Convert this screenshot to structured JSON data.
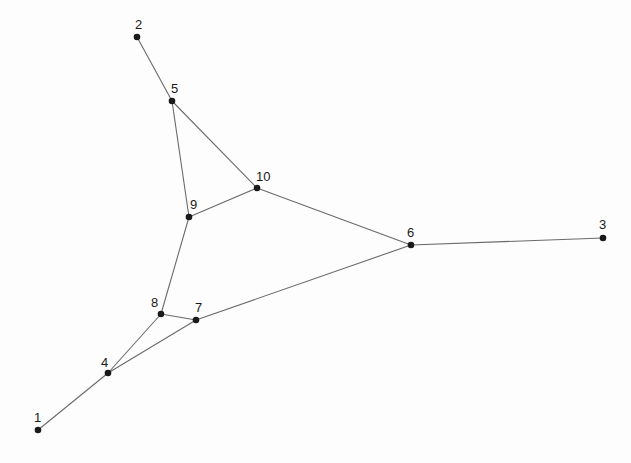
{
  "diagram": {
    "type": "undirected-graph",
    "colors": {
      "background": "#fdfdfd",
      "edge": "#6a6a6a",
      "node": "#1a1a1a",
      "label": "#1a1a1a"
    },
    "nodes": [
      {
        "id": "1",
        "label": "1",
        "x": 38,
        "y": 430,
        "lx": 34,
        "ly": 422
      },
      {
        "id": "2",
        "label": "2",
        "x": 137,
        "y": 37,
        "lx": 135,
        "ly": 29
      },
      {
        "id": "3",
        "label": "3",
        "x": 603,
        "y": 238,
        "lx": 599,
        "ly": 229
      },
      {
        "id": "4",
        "label": "4",
        "x": 108,
        "y": 373,
        "lx": 101,
        "ly": 367
      },
      {
        "id": "5",
        "label": "5",
        "x": 172,
        "y": 101,
        "lx": 171,
        "ly": 93
      },
      {
        "id": "6",
        "label": "6",
        "x": 411,
        "y": 245,
        "lx": 407,
        "ly": 237
      },
      {
        "id": "7",
        "label": "7",
        "x": 196,
        "y": 320,
        "lx": 195,
        "ly": 312
      },
      {
        "id": "8",
        "label": "8",
        "x": 161,
        "y": 314,
        "lx": 151,
        "ly": 307
      },
      {
        "id": "9",
        "label": "9",
        "x": 189,
        "y": 217,
        "lx": 190,
        "ly": 209
      },
      {
        "id": "10",
        "label": "10",
        "x": 257,
        "y": 188,
        "lx": 256,
        "ly": 181
      }
    ],
    "edges": [
      [
        "2",
        "5"
      ],
      [
        "5",
        "9"
      ],
      [
        "5",
        "10"
      ],
      [
        "9",
        "10"
      ],
      [
        "10",
        "6"
      ],
      [
        "6",
        "3"
      ],
      [
        "9",
        "8"
      ],
      [
        "8",
        "7"
      ],
      [
        "8",
        "4"
      ],
      [
        "4",
        "7"
      ],
      [
        "7",
        "6"
      ],
      [
        "4",
        "1"
      ]
    ]
  }
}
